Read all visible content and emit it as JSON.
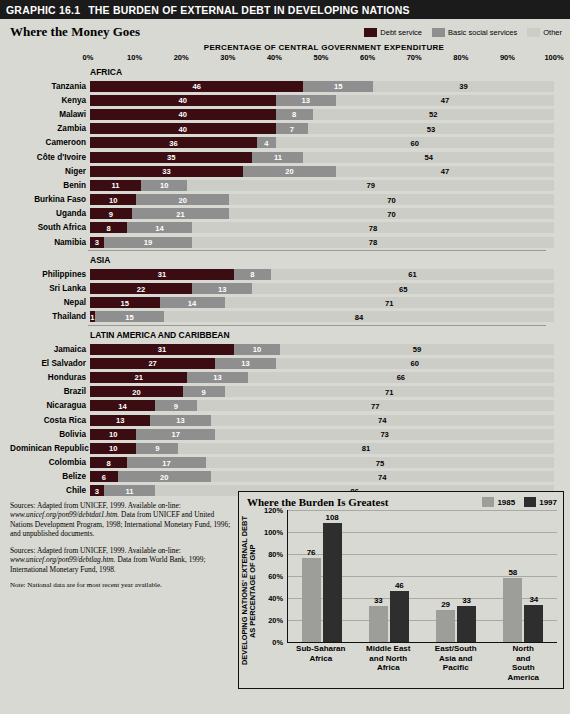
{
  "header": {
    "graphic_number": "GRAPHIC 16.1",
    "title": "THE BURDEN OF EXTERNAL DEBT IN DEVELOPING NATIONS"
  },
  "main_panel": {
    "title": "Where the Money Goes",
    "axis_title": "PERCENTAGE OF CENTRAL GOVERNMENT EXPENDITURE",
    "legend": [
      {
        "label": "Debt service",
        "color": "#3b0d12"
      },
      {
        "label": "Basic social services",
        "color": "#8f8f8f"
      },
      {
        "label": "Other",
        "color": "#cdcdc8"
      }
    ],
    "tick_labels": [
      "0%",
      "10%",
      "20%",
      "30%",
      "40%",
      "50%",
      "60%",
      "70%",
      "80%",
      "90%",
      "100%"
    ]
  },
  "chart_data": [
    {
      "type": "bar",
      "orientation": "horizontal-stacked",
      "title": "Where the Money Goes",
      "xlabel": "PERCENTAGE OF CENTRAL GOVERNMENT EXPENDITURE",
      "ylabel": "",
      "xlim": [
        0,
        100
      ],
      "grid": false,
      "legend_position": "top-right",
      "series": [
        {
          "name": "Debt service",
          "color": "#3b0d12"
        },
        {
          "name": "Basic social services",
          "color": "#8f8f8f"
        },
        {
          "name": "Other",
          "color": "#cdcdc8"
        }
      ],
      "groups": [
        {
          "name": "AFRICA",
          "rows": [
            {
              "country": "Tanzania",
              "values": [
                46,
                15,
                39
              ]
            },
            {
              "country": "Kenya",
              "values": [
                40,
                13,
                47
              ]
            },
            {
              "country": "Malawi",
              "values": [
                40,
                8,
                52
              ]
            },
            {
              "country": "Zambia",
              "values": [
                40,
                7,
                53
              ]
            },
            {
              "country": "Cameroon",
              "values": [
                36,
                4,
                60
              ]
            },
            {
              "country": "Côte d'Ivoire",
              "values": [
                35,
                11,
                54
              ]
            },
            {
              "country": "Niger",
              "values": [
                33,
                20,
                47
              ]
            },
            {
              "country": "Benin",
              "values": [
                11,
                10,
                79
              ]
            },
            {
              "country": "Burkina Faso",
              "values": [
                10,
                20,
                70
              ]
            },
            {
              "country": "Uganda",
              "values": [
                9,
                21,
                70
              ]
            },
            {
              "country": "South Africa",
              "values": [
                8,
                14,
                78
              ]
            },
            {
              "country": "Namibia",
              "values": [
                3,
                19,
                78
              ]
            }
          ]
        },
        {
          "name": "ASIA",
          "rows": [
            {
              "country": "Philippines",
              "values": [
                31,
                8,
                61
              ]
            },
            {
              "country": "Sri Lanka",
              "values": [
                22,
                13,
                65
              ]
            },
            {
              "country": "Nepal",
              "values": [
                15,
                14,
                71
              ]
            },
            {
              "country": "Thailand",
              "values": [
                1,
                15,
                84
              ]
            }
          ]
        },
        {
          "name": "LATIN AMERICA AND CARIBBEAN",
          "rows": [
            {
              "country": "Jamaica",
              "values": [
                31,
                10,
                59
              ]
            },
            {
              "country": "El Salvador",
              "values": [
                27,
                13,
                60
              ]
            },
            {
              "country": "Honduras",
              "values": [
                21,
                13,
                66
              ]
            },
            {
              "country": "Brazil",
              "values": [
                20,
                9,
                71
              ]
            },
            {
              "country": "Nicaragua",
              "values": [
                14,
                9,
                77
              ]
            },
            {
              "country": "Costa Rica",
              "values": [
                13,
                13,
                74
              ]
            },
            {
              "country": "Bolivia",
              "values": [
                10,
                17,
                73
              ]
            },
            {
              "country": "Dominican Republic",
              "values": [
                10,
                9,
                81
              ]
            },
            {
              "country": "Colombia",
              "values": [
                8,
                17,
                75
              ]
            },
            {
              "country": "Belize",
              "values": [
                6,
                20,
                74
              ]
            },
            {
              "country": "Chile",
              "values": [
                3,
                11,
                86
              ]
            }
          ]
        }
      ]
    },
    {
      "type": "bar",
      "orientation": "vertical-grouped",
      "title": "Where the Burden Is Greatest",
      "ylabel": "DEVELOPING NATIONS' EXTERNAL DEBT AS PERCENTAGE OF GNP",
      "xlabel": "",
      "ylim": [
        0,
        120
      ],
      "yticks": [
        "0%",
        "20%",
        "40%",
        "60%",
        "80%",
        "100%",
        "120%"
      ],
      "grid": true,
      "legend_position": "top-right",
      "categories": [
        "Sub-Saharan\nAfrica",
        "Middle East\nand North\nAfrica",
        "East/South\nAsia and\nPacific",
        "North and\nSouth America"
      ],
      "series": [
        {
          "name": "1985",
          "color": "#9d9d99",
          "values": [
            76,
            33,
            29,
            58
          ]
        },
        {
          "name": "1997",
          "color": "#2e2e2e",
          "values": [
            108,
            46,
            33,
            34
          ]
        }
      ]
    }
  ],
  "sources": [
    "Sources: Adapted from UNICEF, 1999. Available on-line: www.unicef.org/pon99/debtdat1.htm. Data from UNICEF and United Nations Development Program, 1998; International Monetary Fund, 1996; and unpublished documents.",
    "Sources: Adapted from UNICEF, 1999. Available on-line: www.unicef.org/pon99/debtlag.htm. Data from World Bank, 1999; International Monetary Fund, 1998."
  ],
  "source_parts": [
    {
      "pre": "Sources: Adapted from UNICEF, 1999. Available on-line:",
      "italic": "www.unicef.org/pon99/debtdat1.htm.",
      "post": " Data from UNICEF and United Nations Development Program, 1998; International Monetary Fund, 1996; and unpublished documents."
    },
    {
      "pre": "Sources: Adapted from UNICEF, 1999. Available on-line:",
      "italic": "www.unicef.org/pon99/debtlag.htm.",
      "post": " Data from World Bank, 1999; International Monetary Fund, 1998."
    }
  ],
  "footnote": "Note: National data are for most recent year available."
}
